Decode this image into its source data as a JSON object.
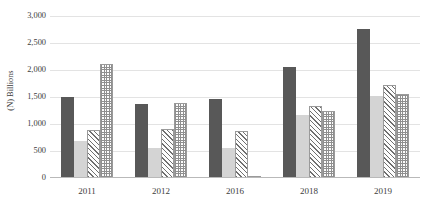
{
  "chart_data": {
    "type": "bar",
    "title": "",
    "title_fragment_visible": "",
    "xlabel": "",
    "ylabel": "(N) Billions",
    "categories": [
      "2011",
      "2012",
      "2016",
      "2018",
      "2019"
    ],
    "series": [
      {
        "name": "series-1",
        "color": "#585858",
        "pattern": "solid-dark",
        "values": [
          1500,
          1370,
          1460,
          2065,
          2760
        ]
      },
      {
        "name": "series-2",
        "color": "#d4d4d4",
        "pattern": "solid-light",
        "values": [
          690,
          565,
          555,
          1165,
          1520
        ]
      },
      {
        "name": "series-3",
        "color": "#6f6f6f",
        "pattern": "diagonal-hatch",
        "values": [
          890,
          910,
          875,
          1340,
          1725
        ]
      },
      {
        "name": "series-4",
        "color": "#8f8f8f",
        "pattern": "checkered-dots",
        "values": [
          2120,
          1385,
          45,
          1245,
          1565
        ]
      }
    ],
    "ylim": [
      0,
      3000
    ],
    "ytick_values": [
      0,
      500,
      1000,
      1500,
      2000,
      2500,
      3000
    ],
    "ytick_labels": [
      "0",
      "500",
      "1,000",
      "1,500",
      "2,000",
      "2,500",
      "3,000"
    ],
    "grid": true,
    "grid_axis": "y",
    "legend": "none",
    "legend_position": "none"
  },
  "axes": {
    "y_title": "(N) Billions"
  }
}
